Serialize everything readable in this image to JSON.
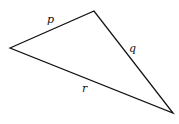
{
  "diagram": {
    "type": "triangle",
    "vertices": {
      "left": [
        10,
        48
      ],
      "top": [
        94,
        11
      ],
      "bottom_right": [
        173,
        113
      ]
    },
    "edges": [
      {
        "name": "p",
        "label": "p",
        "from": "left",
        "to": "top",
        "label_pos": [
          47,
          23
        ]
      },
      {
        "name": "q",
        "label": "q",
        "from": "top",
        "to": "bottom_right",
        "label_pos": [
          129,
          52
        ]
      },
      {
        "name": "r",
        "label": "r",
        "from": "left",
        "to": "bottom_right",
        "label_pos": [
          82,
          92
        ]
      }
    ],
    "stroke_color": "#111111",
    "background": "#ffffff"
  }
}
